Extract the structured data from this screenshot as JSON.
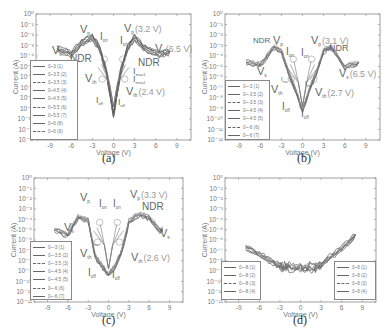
{
  "figure": {
    "panels": [
      {
        "id": "a",
        "label": "(a)"
      },
      {
        "id": "b",
        "label": "(b)"
      },
      {
        "id": "c",
        "label": "(c)"
      },
      {
        "id": "d",
        "label": "(d)"
      }
    ],
    "xlabel": "Voltage (V)",
    "ylabel": "Current (A)",
    "xticks": [
      "-9",
      "-6",
      "-3",
      "0",
      "3",
      "6",
      "9"
    ],
    "yticks": [
      "10⁰",
      "10⁻¹",
      "10⁻²",
      "10⁻³",
      "10⁻⁴",
      "10⁻⁵",
      "10⁻⁶",
      "10⁻⁷",
      "10⁻⁸",
      "10⁻⁹",
      "10⁻¹⁰",
      "10⁻¹¹",
      "10⁻¹²"
    ]
  },
  "legends": {
    "a": [
      "0~3 (1)",
      "0~3.5 (2)",
      "0~3.5 (3)",
      "0~4.5 (4)",
      "0~4.5 (5)",
      "0~5.5 (6)",
      "0~5.5 (7)",
      "0~6 (8)",
      "0~6 (9)"
    ],
    "b": [
      "0~-3 (1)",
      "0~-3.5 (2)",
      "0~-3.5 (3)",
      "0~-4.5 (4)",
      "0~-4.5 (5)",
      "0~-6 (6)",
      "0~-6 (7)"
    ],
    "c": [
      "0~-3 (1)",
      "0~-3.5 (2)",
      "0~-3.5 (3)",
      "0~-4.5 (4)",
      "0~-4.5 (5)",
      "0~-6 (6)",
      "0~-6 (7)"
    ],
    "d_left": [
      "0~-8 (1)",
      "0~-8 (2)",
      "0~-8 (3)",
      "0~-8 (4)"
    ],
    "d_right": [
      "0~8 (1)",
      "0~8 (2)",
      "0~8 (3)",
      "0~8 (4)"
    ]
  },
  "annotations": {
    "a": {
      "vs_left": "V",
      "vs_left_sub": "s",
      "vp_left": "V",
      "vp_left_sub": "p",
      "ion1": "I",
      "ion1_sub": "on",
      "ion2": "I",
      "ion2_sub": "on",
      "vp_right": "V",
      "vp_right_sub": "p",
      "vp_right_val": "(3.2 V)",
      "vs_right": "V",
      "vs_right_sub": "s",
      "vs_right_val": "(6.5 V)",
      "ndr_left": "NDR",
      "ndr_right": "NDR",
      "imax1": "I",
      "imax1_sub": "max1",
      "imax2": "I",
      "imax2_sub": "max2",
      "vth_left": "V",
      "vth_left_sub": "th",
      "vth_right": "V",
      "vth_right_sub": "th",
      "vth_right_val": "(2.4 V)",
      "ioff1": "I",
      "ioff1_sub": "off",
      "ioff2": "I",
      "ioff2_sub": "off"
    },
    "b": {
      "ndr_left": "NDR",
      "vp_left": "V",
      "vp_left_sub": "p",
      "ion1": "I",
      "ion1_sub": "on",
      "ion2": "I",
      "ion2_sub": "on",
      "vp_right": "V",
      "vp_right_sub": "p",
      "vp_right_val": "(3.1 V)",
      "ndr_right": "NDR",
      "vs_left": "V",
      "vs_left_sub": "s",
      "vs_right": "V",
      "vs_right_sub": "s",
      "vs_right_val": "(6.5 V)",
      "imax1": "I",
      "imax1_sub": "max",
      "imax2": "I",
      "imax2_sub": "max",
      "vth_left": "V",
      "vth_left_sub": "th",
      "vth_right": "V",
      "vth_right_sub": "th",
      "vth_right_val": "(2.7 V)",
      "ioff1": "I",
      "ioff1_sub": "off",
      "ioff2": "I",
      "ioff2_sub": "off"
    },
    "c": {
      "vp_left": "V",
      "vp_left_sub": "p",
      "ion1": "I",
      "ion1_sub": "on",
      "ion2": "I",
      "ion2_sub": "on",
      "vp_right": "V",
      "vp_right_sub": "p",
      "vp_right_val": "(3.3 V)",
      "ndr_right": "NDR",
      "vs_left": "V",
      "vs_left_sub": "s",
      "vs_right": "V",
      "vs_right_sub": "s",
      "imax": "I",
      "imax_sub": "max",
      "vth_left": "V",
      "vth_left_sub": "th",
      "vth_right": "V",
      "vth_right_sub": "th",
      "vth_right_val": "(2.6 V)",
      "ioff1": "I",
      "ioff1_sub": "off",
      "ioff2": "I",
      "ioff2_sub": "off"
    }
  },
  "chart_data": [
    {
      "type": "line",
      "title": "(a)",
      "xlabel": "Voltage (V)",
      "ylabel": "Current (A)",
      "xlim": [
        -11,
        11
      ],
      "ylim_log10": [
        -12,
        0
      ],
      "yscale": "log",
      "grid": false,
      "legend_position": "left",
      "series_names": [
        "0~3 (1)",
        "0~3.5 (2)",
        "0~3.5 (3)",
        "0~4.5 (4)",
        "0~4.5 (5)",
        "0~5.5 (6)",
        "0~5.5 (7)",
        "0~6 (8)",
        "0~6 (9)"
      ],
      "envelope": {
        "x": [
          -8,
          -6,
          -4.5,
          -3,
          -2,
          -1,
          0,
          1,
          2,
          3,
          4.5,
          6.5,
          8
        ],
        "log10_current": [
          -3.3,
          -3.8,
          -2.7,
          -2.2,
          -3.2,
          -5.5,
          -9.6,
          -5.5,
          -3.2,
          -2.2,
          -3.3,
          -3.8,
          -3.6
        ]
      },
      "annotations": [
        "Vs",
        "Vp",
        "Ion",
        "Ion",
        "Vp (3.2 V)",
        "Vs (6.5 V)",
        "NDR",
        "NDR",
        "Imax1",
        "Imax2",
        "Vth",
        "Vth (2.4 V)",
        "Ioff",
        "Ioff"
      ]
    },
    {
      "type": "line",
      "title": "(b)",
      "xlabel": "Voltage (V)",
      "ylabel": "Current (A)",
      "xlim": [
        -11,
        11
      ],
      "ylim_log10": [
        -12,
        0
      ],
      "yscale": "log",
      "grid": false,
      "legend_position": "left",
      "series_names": [
        "0~-3 (1)",
        "0~-3.5 (2)",
        "0~-3.5 (3)",
        "0~-4.5 (4)",
        "0~-4.5 (5)",
        "0~-6 (6)",
        "0~-6 (7)"
      ],
      "envelope": {
        "x": [
          -8,
          -6,
          -4,
          -3,
          -2,
          -1,
          0,
          1,
          2,
          3,
          4,
          6,
          8
        ],
        "log10_current": [
          -4.5,
          -4.8,
          -3.1,
          -3.5,
          -5.5,
          -7.2,
          -9.2,
          -7.2,
          -5.5,
          -3.5,
          -3.1,
          -5.0,
          -4.6
        ]
      },
      "annotations": [
        "NDR",
        "Vp",
        "Ion",
        "Ion",
        "Vp (3.1 V)",
        "NDR",
        "Vs",
        "Vs (6.5 V)",
        "Imax",
        "Imax",
        "Vth",
        "Vth (2.7 V)",
        "Ioff",
        "Ioff"
      ]
    },
    {
      "type": "line",
      "title": "(c)",
      "xlabel": "Voltage (V)",
      "ylabel": "Current (A)",
      "xlim": [
        -11,
        11
      ],
      "ylim_log10": [
        -12,
        0
      ],
      "yscale": "log",
      "grid": false,
      "legend_position": "left",
      "series_names": [
        "0~-3 (1)",
        "0~-3.5 (2)",
        "0~-3.5 (3)",
        "0~-4.5 (4)",
        "0~-4.5 (5)",
        "0~-6 (6)",
        "0~-6 (7)"
      ],
      "envelope": {
        "x": [
          -8,
          -6,
          -4.5,
          -3,
          -2,
          -1,
          0,
          1,
          2,
          3,
          4.5,
          6,
          7.5,
          8
        ],
        "log10_current": [
          -5.0,
          -5.5,
          -3.8,
          -4.0,
          -7.5,
          -8.5,
          -9.3,
          -8.5,
          -7.0,
          -4.2,
          -3.5,
          -3.8,
          -5.0,
          -5.0
        ]
      },
      "annotations": [
        "Vp",
        "Ion",
        "Ion",
        "Vp (3.3 V)",
        "NDR",
        "Vs",
        "Vs",
        "Imax",
        "Vth",
        "Vth (2.6 V)",
        "Ioff",
        "Ioff"
      ]
    },
    {
      "type": "line",
      "title": "(d)",
      "xlabel": "Voltage (V)",
      "ylabel": "Current (A)",
      "xlim": [
        -11,
        11
      ],
      "ylim_log10": [
        -12,
        0
      ],
      "yscale": "log",
      "grid": false,
      "legend_position": "bottom-left and bottom-right",
      "series_names": [
        "0~-8 (1)",
        "0~-8 (2)",
        "0~-8 (3)",
        "0~-8 (4)",
        "0~8 (1)",
        "0~8 (2)",
        "0~8 (3)",
        "0~8 (4)"
      ],
      "envelope": {
        "x": [
          -8,
          -6,
          -4,
          -3,
          -2,
          0,
          2,
          3,
          4,
          6,
          8
        ],
        "log10_current": [
          -6.6,
          -7.4,
          -8.1,
          -8.5,
          -8.6,
          -8.7,
          -8.6,
          -8.4,
          -7.8,
          -6.8,
          -5.5
        ]
      }
    }
  ]
}
